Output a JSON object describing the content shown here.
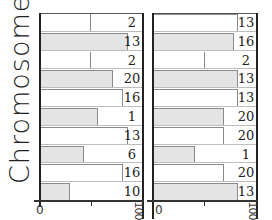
{
  "chart_data": [
    {
      "type": "bar",
      "orientation": "horizontal",
      "title": "",
      "ylabel": "Chromosomes",
      "xlabel": "",
      "xlim": [
        0,
        100
      ],
      "xticks": [
        "0",
        "",
        "100"
      ],
      "row_labels": [
        "2",
        "13",
        "2",
        "20",
        "16",
        "1",
        "13",
        "6",
        "16",
        "10"
      ],
      "values": [
        50,
        86,
        50,
        72,
        81,
        57,
        86,
        43,
        81,
        29
      ],
      "fills": [
        "empty",
        "gray",
        "empty",
        "gray",
        "white",
        "gray",
        "white",
        "gray",
        "white",
        "gray"
      ]
    },
    {
      "type": "bar",
      "orientation": "horizontal",
      "title": "",
      "ylabel": "",
      "xlabel": "",
      "xlim": [
        0,
        100
      ],
      "xticks": [
        "0",
        "",
        "100"
      ],
      "row_labels": [
        "13",
        "16",
        "2",
        "13",
        "13",
        "20",
        "20",
        "1",
        "20",
        "13"
      ],
      "values": [
        83,
        79,
        50,
        83,
        83,
        69,
        69,
        41,
        69,
        83
      ],
      "fills": [
        "white",
        "gray",
        "empty",
        "gray",
        "white",
        "gray",
        "white",
        "gray",
        "white",
        "gray"
      ]
    }
  ],
  "axis": {
    "ylabel": "Chromosomes",
    "tick_zero": "0",
    "tick_end": "100"
  },
  "colors": {
    "gray_bar": "#e4e4e4",
    "white_bar": "#ffffff",
    "axis": "#222222"
  }
}
